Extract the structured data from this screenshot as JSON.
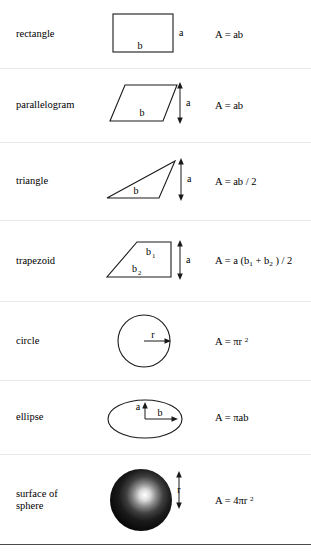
{
  "table": {
    "rows": [
      {
        "name": "rectangle",
        "shape": "rectangle",
        "formula_plain": "A = ab",
        "labels": {
          "side_a": "a",
          "side_b": "b"
        }
      },
      {
        "name": "parallelogram",
        "shape": "parallelogram",
        "formula_plain": "A = ab",
        "labels": {
          "height_a": "a",
          "base_b": "b"
        }
      },
      {
        "name": "triangle",
        "shape": "triangle",
        "formula_plain": "A = ab / 2",
        "labels": {
          "height_a": "a",
          "base_b": "b"
        }
      },
      {
        "name": "trapezoid",
        "shape": "trapezoid",
        "formula_plain": "A = a (b1 + b2) / 2",
        "labels": {
          "height_a": "a",
          "top_b1": "b",
          "top_b1_sub": "1",
          "bottom_b2": "b",
          "bottom_b2_sub": "2"
        }
      },
      {
        "name": "circle",
        "shape": "circle",
        "formula_plain": "A = πr 2",
        "labels": {
          "radius_r": "r"
        }
      },
      {
        "name": "ellipse",
        "shape": "ellipse",
        "formula_plain": "A = πab",
        "labels": {
          "semi_minor_a": "a",
          "semi_major_b": "b"
        }
      },
      {
        "name": "surface of sphere",
        "name_line1": "surface of",
        "name_line2": "sphere",
        "shape": "sphere",
        "formula_plain": "A = 4πr 2",
        "labels": {
          "radius_r": "r"
        }
      }
    ],
    "formula_parts": {
      "rectangle": {
        "lhs": "A = ",
        "rhs": "ab"
      },
      "parallelogram": {
        "lhs": "A = ",
        "rhs": "ab"
      },
      "triangle": {
        "lhs": "A = ",
        "rhs": "ab / 2"
      },
      "trapezoid": {
        "p1": "A = a (b",
        "sub1": "1",
        "p2": " + b",
        "sub2": "2",
        "p3": " ) / 2"
      },
      "circle": {
        "p1": "A = ",
        "pi": "π",
        "p2": "r ",
        "exp": "2"
      },
      "ellipse": {
        "p1": "A = ",
        "pi": "π",
        "p2": "ab"
      },
      "sphere": {
        "p1": "A = 4",
        "pi": "π",
        "p2": "r ",
        "exp": "2"
      }
    }
  },
  "colors": {
    "ink": "#1a1a1a",
    "rule": "#4a4a4a",
    "row_divider": "#e9e9e9",
    "sphere_dark": "#0d0d0d",
    "sphere_highlight": "#ffffff"
  }
}
